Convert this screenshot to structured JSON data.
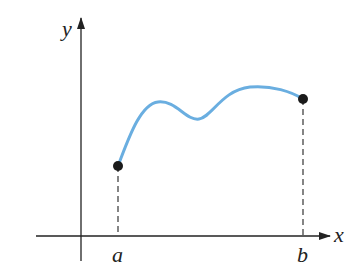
{
  "diagram": {
    "axes": {
      "x_label": "x",
      "y_label": "y"
    },
    "points": [
      {
        "label": "a",
        "description": "left endpoint of curve"
      },
      {
        "label": "b",
        "description": "right endpoint of curve"
      }
    ],
    "colors": {
      "curve": "#6aaee0",
      "axes": "#222222",
      "points": "#1a1a1a"
    }
  }
}
